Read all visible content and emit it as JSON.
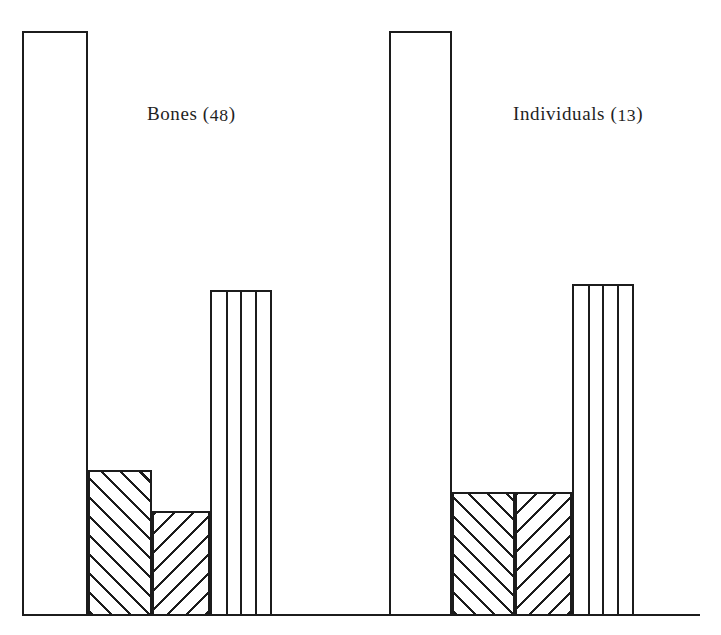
{
  "chart_data": {
    "type": "bar",
    "title": "",
    "subtitle": "",
    "xlabel": "",
    "ylabel": "",
    "grid": false,
    "legend_position": "none",
    "axis": {
      "baseline_visible": true,
      "y_axis_visible": false,
      "ylim": [
        0,
        100
      ],
      "value_unit": "percent"
    },
    "groups": [
      {
        "name": "Bones",
        "count": 48,
        "label": "Bones (48)",
        "label_text": "Bones",
        "label_count": "48",
        "categories": [
          "Category 1",
          "Category 2",
          "Category 3",
          "Category 4"
        ],
        "values": [
          100,
          24.7,
          17.7,
          55.6
        ],
        "bars": [
          {
            "category": "Category 1",
            "value": 100,
            "fill": "plain",
            "stripes": 0
          },
          {
            "category": "Category 2",
            "value": 24.7,
            "fill": "hatch-up",
            "stripes": 0
          },
          {
            "category": "Category 3",
            "value": 17.7,
            "fill": "hatch-down",
            "stripes": 0
          },
          {
            "category": "Category 4",
            "value": 55.6,
            "fill": "vertical",
            "stripes": 3
          }
        ]
      },
      {
        "name": "Individuals",
        "count": 13,
        "label": "Individuals (13)",
        "label_text": "Individuals",
        "label_count": "13",
        "categories": [
          "Category 1",
          "Category 2",
          "Category 3",
          "Category 4"
        ],
        "values": [
          100,
          20.9,
          20.9,
          56.6
        ],
        "bars": [
          {
            "category": "Category 1",
            "value": 100,
            "fill": "plain",
            "stripes": 0
          },
          {
            "category": "Category 2",
            "value": 20.9,
            "fill": "hatch-up",
            "stripes": 0
          },
          {
            "category": "Category 3",
            "value": 20.9,
            "fill": "hatch-down",
            "stripes": 0
          },
          {
            "category": "Category 4",
            "value": 56.6,
            "fill": "vertical",
            "stripes": 3
          }
        ]
      }
    ],
    "colors": {
      "ink": "#1c1c1c",
      "paper": "#ffffff"
    }
  },
  "layout": {
    "baseline_y": 614,
    "baseline_x0": 22,
    "baseline_x1": 700,
    "plot_top": 31,
    "bar_geometry": [
      {
        "x": 22,
        "w": 66,
        "top": 31
      },
      {
        "x": 88,
        "w": 64,
        "top": 470
      },
      {
        "x": 152,
        "w": 58,
        "top": 511
      },
      {
        "x": 210,
        "w": 62,
        "top": 290
      },
      {
        "x": 389,
        "w": 63,
        "top": 31
      },
      {
        "x": 452,
        "w": 63,
        "top": 492
      },
      {
        "x": 515,
        "w": 57,
        "top": 492
      },
      {
        "x": 572,
        "w": 62,
        "top": 284
      }
    ],
    "labels": [
      {
        "text": "Bones (48)",
        "x": 147,
        "y": 103
      },
      {
        "text": "Individuals (13)",
        "x": 513,
        "y": 103
      }
    ]
  }
}
